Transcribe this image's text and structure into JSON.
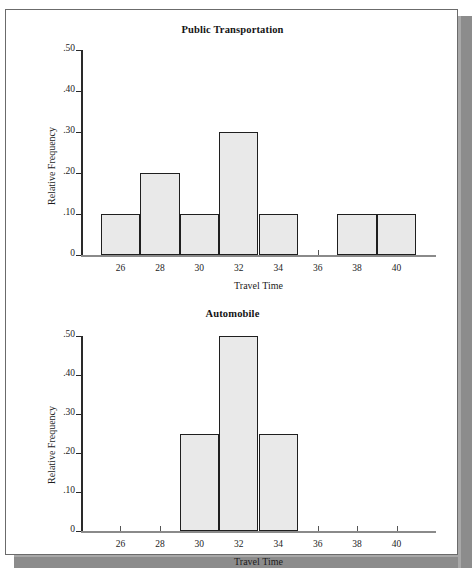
{
  "page": {
    "background_color": "#ffffff",
    "frame_border_color": "#6b6b6b",
    "shadow_color": "#8c8c8c"
  },
  "style": {
    "bar_fill": "#e9e9e9",
    "bar_stroke": "#1f1f1f",
    "axis_color": "#2a2a2a"
  },
  "chart_data": [
    {
      "type": "bar",
      "title": "Public Transportation",
      "xlabel": "Travel Time",
      "ylabel": "Relative Frequency",
      "xlim": [
        24,
        42
      ],
      "ylim": [
        0,
        0.5
      ],
      "grid": false,
      "legend": "none",
      "xticks": [
        26,
        28,
        30,
        32,
        34,
        36,
        38,
        40
      ],
      "xtick_labels": [
        "26",
        "28",
        "30",
        "32",
        "34",
        "36",
        "38",
        "40"
      ],
      "yticks": [
        0,
        0.1,
        0.2,
        0.3,
        0.4,
        0.5
      ],
      "ytick_labels": [
        "0",
        ".10",
        ".20",
        ".30",
        ".40",
        ".50"
      ],
      "bins": [
        {
          "start": 25,
          "end": 27,
          "value": 0.1
        },
        {
          "start": 27,
          "end": 29,
          "value": 0.2
        },
        {
          "start": 29,
          "end": 31,
          "value": 0.1
        },
        {
          "start": 31,
          "end": 33,
          "value": 0.3
        },
        {
          "start": 33,
          "end": 35,
          "value": 0.1
        },
        {
          "start": 37,
          "end": 39,
          "value": 0.1
        },
        {
          "start": 39,
          "end": 41,
          "value": 0.1
        }
      ]
    },
    {
      "type": "bar",
      "title": "Automobile",
      "xlabel": "Travel Time",
      "ylabel": "Relative Frequency",
      "xlim": [
        24,
        42
      ],
      "ylim": [
        0,
        0.5
      ],
      "grid": false,
      "legend": "none",
      "xticks": [
        26,
        28,
        30,
        32,
        34,
        36,
        38,
        40
      ],
      "xtick_labels": [
        "26",
        "28",
        "30",
        "32",
        "34",
        "36",
        "38",
        "40"
      ],
      "yticks": [
        0,
        0.1,
        0.2,
        0.3,
        0.4,
        0.5
      ],
      "ytick_labels": [
        "0",
        ".10",
        ".20",
        ".30",
        ".40",
        ".50"
      ],
      "bins": [
        {
          "start": 29,
          "end": 31,
          "value": 0.25
        },
        {
          "start": 31,
          "end": 33,
          "value": 0.5
        },
        {
          "start": 33,
          "end": 35,
          "value": 0.25
        }
      ]
    }
  ]
}
